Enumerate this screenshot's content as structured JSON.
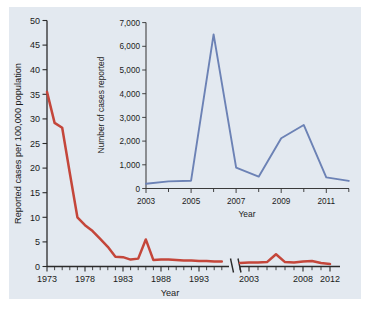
{
  "figure": {
    "background_color": "#e3e9f0",
    "page_color": "#ffffff"
  },
  "chart_data": [
    {
      "id": "main",
      "type": "line",
      "title": "",
      "xlabel": "Year",
      "ylabel": "Reported cases per 100,000 population",
      "series_color": "#c4463a",
      "ylim": [
        0,
        50
      ],
      "ytick_labels": [
        "0",
        "5",
        "10",
        "15",
        "20",
        "25",
        "30",
        "35",
        "40",
        "45",
        "50"
      ],
      "ytick_values": [
        0,
        5,
        10,
        15,
        20,
        25,
        30,
        35,
        40,
        45,
        50
      ],
      "xtick_labels_left": [
        "1973",
        "1978",
        "1983",
        "1988",
        "1993"
      ],
      "xtick_values_left": [
        1973,
        1978,
        1983,
        1988,
        1993
      ],
      "xtick_labels_right": [
        "2003",
        "2008",
        "2012"
      ],
      "xtick_values_right": [
        2003,
        2008,
        2012
      ],
      "axis_break": true,
      "grid": false,
      "legend": "none",
      "segments": [
        {
          "name": "1973-1996",
          "x": [
            1973,
            1974,
            1975,
            1976,
            1977,
            1978,
            1979,
            1980,
            1981,
            1982,
            1983,
            1984,
            1985,
            1986,
            1987,
            1988,
            1989,
            1990,
            1991,
            1992,
            1993,
            1994,
            1995,
            1996
          ],
          "y": [
            35.5,
            29.2,
            28.2,
            19.0,
            10.0,
            8.4,
            7.2,
            5.6,
            4.0,
            2.0,
            1.9,
            1.4,
            1.6,
            5.5,
            1.3,
            1.4,
            1.4,
            1.3,
            1.2,
            1.2,
            1.1,
            1.1,
            1.0,
            1.0
          ]
        },
        {
          "name": "2002-2012",
          "x": [
            2002,
            2003,
            2004,
            2005,
            2006,
            2007,
            2008,
            2009,
            2010,
            2011,
            2012
          ],
          "y": [
            0.7,
            0.8,
            0.8,
            0.9,
            2.5,
            0.9,
            0.8,
            1.0,
            1.1,
            0.7,
            0.5
          ]
        }
      ]
    },
    {
      "id": "inset",
      "type": "line",
      "title": "",
      "xlabel": "Year",
      "ylabel": "Number of cases reported",
      "series_color": "#6c82b5",
      "ylim": [
        0,
        7000
      ],
      "ytick_labels": [
        "0",
        "1,000",
        "2,000",
        "3,000",
        "4,000",
        "5,000",
        "6,000",
        "7,000"
      ],
      "ytick_values": [
        0,
        1000,
        2000,
        3000,
        4000,
        5000,
        6000,
        7000
      ],
      "xtick_labels": [
        "2003",
        "2005",
        "2007",
        "2009",
        "2011"
      ],
      "xtick_values": [
        2003,
        2005,
        2007,
        2009,
        2011
      ],
      "xlim": [
        2003,
        2012
      ],
      "grid": false,
      "legend": "none",
      "series": [
        {
          "name": "Number of cases reported",
          "x": [
            2003,
            2004,
            2005,
            2006,
            2007,
            2008,
            2009,
            2010,
            2011,
            2012
          ],
          "values": [
            200,
            300,
            330,
            6500,
            880,
            500,
            2120,
            2680,
            470,
            320
          ]
        }
      ]
    }
  ]
}
